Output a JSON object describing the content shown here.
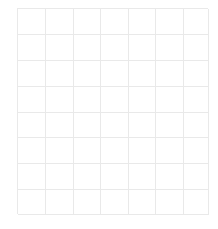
{
  "page": {
    "background_color": "#ffffff",
    "width": 218,
    "height": 229
  },
  "grid": {
    "name": "empty-grid-table",
    "columns": 7,
    "rows": 8,
    "line_color": "#e9e9e9",
    "line_width_px": 1,
    "cell_background": "#ffffff",
    "bounds": {
      "left": 17,
      "top": 8,
      "width": 191,
      "height": 206
    },
    "column_widths": [
      28,
      28,
      27,
      28,
      27,
      28,
      25
    ],
    "row_heights": [
      26,
      26,
      26,
      26,
      25,
      26,
      26,
      25
    ],
    "cells": [
      [
        "",
        "",
        "",
        "",
        "",
        "",
        ""
      ],
      [
        "",
        "",
        "",
        "",
        "",
        "",
        ""
      ],
      [
        "",
        "",
        "",
        "",
        "",
        "",
        ""
      ],
      [
        "",
        "",
        "",
        "",
        "",
        "",
        ""
      ],
      [
        "",
        "",
        "",
        "",
        "",
        "",
        ""
      ],
      [
        "",
        "",
        "",
        "",
        "",
        "",
        ""
      ],
      [
        "",
        "",
        "",
        "",
        "",
        "",
        ""
      ],
      [
        "",
        "",
        "",
        "",
        "",
        "",
        ""
      ]
    ]
  }
}
